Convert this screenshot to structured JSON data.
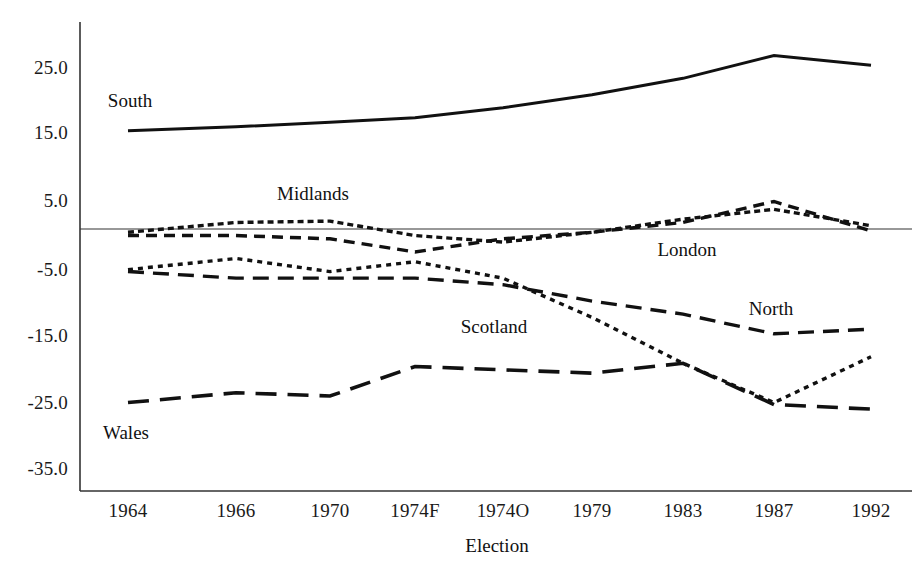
{
  "chart_data": {
    "type": "line",
    "title": "",
    "xlabel": "Election",
    "ylabel": "",
    "categories": [
      "1964",
      "1966",
      "1970",
      "1974F",
      "1974O",
      "1979",
      "1983",
      "1987",
      "1992"
    ],
    "ylim": [
      -35.0,
      30.0
    ],
    "yticks": [
      "25.0",
      "15.0",
      "5.0",
      "-5.0",
      "-15.0",
      "-25.0",
      "-35.0"
    ],
    "ytick_values": [
      25.0,
      15.0,
      5.0,
      -5.0,
      -15.0,
      -25.0,
      -35.0
    ],
    "grid": false,
    "legend": "inline-annotations",
    "zero_line": true,
    "series": [
      {
        "name": "South",
        "style": "solid",
        "label_x": "1964",
        "values": [
          15.0,
          15.6,
          16.3,
          17.0,
          18.5,
          20.5,
          23.0,
          26.5,
          25.0
        ]
      },
      {
        "name": "Midlands",
        "style": "fine-dotted",
        "label_x": "1970",
        "values": [
          -0.5,
          1.0,
          1.2,
          -1.0,
          -2.0,
          -0.5,
          1.5,
          3.0,
          0.5
        ]
      },
      {
        "name": "London",
        "style": "short-dashed",
        "label_x": "1979",
        "values": [
          -1.0,
          -1.0,
          -1.5,
          -3.5,
          -1.5,
          -0.5,
          1.0,
          4.2,
          -0.3
        ]
      },
      {
        "name": "Scotland",
        "style": "dotted",
        "label_x": "1974F",
        "values": [
          -6.2,
          -4.5,
          -6.5,
          -5.0,
          -7.5,
          -13.5,
          -20.5,
          -26.5,
          -19.5
        ]
      },
      {
        "name": "North",
        "style": "dashed",
        "label_x": "1987",
        "values": [
          -6.5,
          -7.5,
          -7.5,
          -7.5,
          -8.5,
          -11.0,
          -13.0,
          -16.0,
          -15.3
        ]
      },
      {
        "name": "Wales",
        "style": "long-dashed",
        "label_x": "1964",
        "values": [
          -26.5,
          -25.0,
          -25.5,
          -21.0,
          -21.5,
          -22.0,
          -20.5,
          -26.8,
          -27.5
        ]
      }
    ],
    "colors": {
      "ink": "#111111",
      "axis": "#333333",
      "background": "#ffffff"
    }
  },
  "annotations": {
    "south": "South",
    "midlands": "Midlands",
    "london": "London",
    "scotland": "Scotland",
    "north": "North",
    "wales": "Wales"
  },
  "axis": {
    "x_title": "Election"
  }
}
